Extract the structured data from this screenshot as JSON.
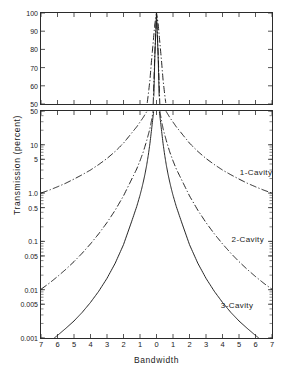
{
  "chart_data": {
    "type": "line",
    "title": "",
    "xlabel": "Bandwidth",
    "ylabel": "Transmission (percent)",
    "grid": false,
    "legend_position": "inline-annotation",
    "panels": [
      {
        "name": "upper-linear-panel",
        "yscale": "linear",
        "ylim": [
          50,
          100
        ],
        "yticks": [
          100,
          90,
          80,
          70,
          60,
          50
        ],
        "ytick_labels": [
          "100",
          "90",
          "80",
          "70",
          "60",
          "50"
        ],
        "xlim": [
          -7,
          7
        ],
        "xticks": [
          -7,
          -6,
          -5,
          -4,
          -3,
          -2,
          -1,
          0,
          1,
          2,
          3,
          4,
          5,
          6,
          7
        ],
        "xtick_labels_shown": false
      },
      {
        "name": "lower-log-panel",
        "yscale": "log",
        "ylim": [
          0.001,
          50
        ],
        "yticks": [
          50,
          10,
          5,
          1.0,
          0.5,
          0.1,
          0.05,
          0.01,
          0.005,
          0.001
        ],
        "ytick_labels": [
          "50",
          "10",
          "5",
          "1.0",
          "0.5",
          "0.1",
          "0.05",
          "0.01",
          "0.005",
          "0.001"
        ],
        "xlim": [
          -7,
          7
        ],
        "xticks": [
          -7,
          -6,
          -5,
          -4,
          -3,
          -2,
          -1,
          0,
          1,
          2,
          3,
          4,
          5,
          6,
          7
        ],
        "xtick_labels": [
          "7",
          "6",
          "5",
          "4",
          "3",
          "2",
          "1",
          "0",
          "1",
          "2",
          "3",
          "4",
          "5",
          "6",
          "7"
        ]
      }
    ],
    "series": [
      {
        "name": "1-Cavity",
        "label": "1-Cavity",
        "linestyle": "dash-dot",
        "color": "#1a1a1a",
        "label_x": 5.05,
        "label_y": 2.6,
        "x": [
          -7,
          -6.5,
          -6,
          -5.5,
          -5,
          -4.5,
          -4,
          -3.5,
          -3,
          -2.5,
          -2,
          -1.5,
          -1.2,
          -1,
          -0.8,
          -0.6,
          -0.5,
          -0.4,
          -0.3,
          -0.2,
          -0.1,
          0,
          0.1,
          0.2,
          0.3,
          0.4,
          0.5,
          0.6,
          0.8,
          1,
          1.2,
          1.5,
          2,
          2.5,
          3,
          3.5,
          4,
          4.5,
          5,
          5.5,
          6,
          6.5,
          7
        ],
        "y": [
          1.0,
          1.15,
          1.35,
          1.6,
          1.95,
          2.4,
          3.0,
          3.9,
          5.2,
          7.3,
          10.8,
          17.6,
          23.5,
          29.5,
          37.0,
          48.0,
          55.0,
          63.0,
          74.0,
          84.0,
          94.0,
          100,
          94.0,
          84.0,
          74.0,
          63.0,
          55.0,
          48.0,
          37.0,
          29.5,
          23.5,
          17.6,
          10.8,
          7.3,
          5.2,
          3.9,
          3.0,
          2.4,
          1.95,
          1.6,
          1.35,
          1.15,
          1.0
        ]
      },
      {
        "name": "2-Cavity",
        "label": "2-Cavity",
        "linestyle": "dash-dot",
        "color": "#1a1a1a",
        "label_x": 4.55,
        "label_y": 0.105,
        "x": [
          -7,
          -6.5,
          -6,
          -5.5,
          -5,
          -4.5,
          -4,
          -3.5,
          -3,
          -2.5,
          -2,
          -1.5,
          -1.2,
          -1,
          -0.8,
          -0.6,
          -0.5,
          -0.4,
          -0.3,
          -0.2,
          -0.1,
          0,
          0.1,
          0.2,
          0.3,
          0.4,
          0.5,
          0.6,
          0.8,
          1,
          1.2,
          1.5,
          2,
          2.5,
          3,
          3.5,
          4,
          4.5,
          5,
          5.5,
          6,
          6.5,
          7
        ],
        "y": [
          0.0102,
          0.0136,
          0.0187,
          0.0263,
          0.0381,
          0.0571,
          0.0888,
          0.144,
          0.245,
          0.444,
          0.875,
          1.95,
          3.15,
          4.65,
          7.15,
          12.0,
          16.0,
          21.5,
          32.0,
          50.0,
          78.0,
          100,
          78.0,
          50.0,
          32.0,
          21.5,
          16.0,
          12.0,
          7.15,
          4.65,
          3.15,
          1.95,
          0.875,
          0.444,
          0.245,
          0.144,
          0.0888,
          0.0571,
          0.0381,
          0.0263,
          0.0187,
          0.0136,
          0.0102
        ]
      },
      {
        "name": "3-Cavity",
        "label": "3-Cavity",
        "linestyle": "solid",
        "color": "#1a1a1a",
        "label_x": 3.9,
        "label_y": 0.0046,
        "x": [
          -6.2,
          -6,
          -5.5,
          -5,
          -4.5,
          -4,
          -3.5,
          -3,
          -2.5,
          -2,
          -1.5,
          -1.2,
          -1,
          -0.9,
          -0.8,
          -0.7,
          -0.6,
          -0.5,
          -0.4,
          -0.3,
          -0.2,
          -0.1,
          0,
          0.1,
          0.2,
          0.3,
          0.4,
          0.5,
          0.6,
          0.7,
          0.8,
          0.9,
          1,
          1.2,
          1.5,
          2,
          2.5,
          3,
          3.5,
          4,
          4.5,
          5,
          5.5,
          6,
          6.2
        ],
        "y": [
          0.001,
          0.00113,
          0.00158,
          0.00225,
          0.0034,
          0.00545,
          0.0093,
          0.0172,
          0.0355,
          0.0855,
          0.262,
          0.525,
          0.9,
          1.22,
          1.7,
          2.45,
          3.7,
          6.0,
          10.5,
          20.5,
          41.0,
          76.0,
          100,
          76.0,
          41.0,
          20.5,
          10.5,
          6.0,
          3.7,
          2.45,
          1.7,
          1.22,
          0.9,
          0.525,
          0.262,
          0.0855,
          0.0355,
          0.0172,
          0.0093,
          0.00545,
          0.0034,
          0.00225,
          0.00158,
          0.00113,
          0.001
        ]
      }
    ]
  }
}
